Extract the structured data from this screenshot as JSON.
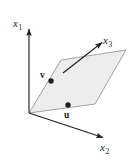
{
  "figure": {
    "background_color": "#ffffff",
    "ink_color": "#231f20",
    "plane_fill_color": "#ededed",
    "plane_stroke_color": "#8c8c8c",
    "axis_color": "#231f20",
    "point_color": "#231f20"
  },
  "axes": [
    {
      "id": "x1",
      "label_base": "x",
      "label_sub": "1",
      "description": "vertical axis pointing up",
      "origin": [
        29,
        113
      ],
      "tip": [
        29,
        26
      ]
    },
    {
      "id": "x2",
      "label_base": "x",
      "label_sub": "2",
      "description": "axis pointing down and to the right",
      "origin": [
        29,
        113
      ],
      "tip": [
        106,
        139
      ]
    },
    {
      "id": "x3",
      "label_base": "x",
      "label_sub": "3",
      "description": "axis pointing up and to the right through the plane",
      "origin": [
        63,
        73
      ],
      "tip": [
        105,
        40
      ]
    }
  ],
  "plane": {
    "name": "spanned-plane",
    "vertices": [
      [
        29,
        113
      ],
      [
        61,
        60
      ],
      [
        126,
        50
      ],
      [
        95,
        104
      ]
    ]
  },
  "points": [
    {
      "id": "v",
      "label": "v",
      "dot": [
        51,
        81
      ],
      "label_pos": [
        41,
        72
      ]
    },
    {
      "id": "u",
      "label": "u",
      "dot": [
        68,
        105
      ],
      "label_pos": [
        65,
        111
      ]
    }
  ]
}
